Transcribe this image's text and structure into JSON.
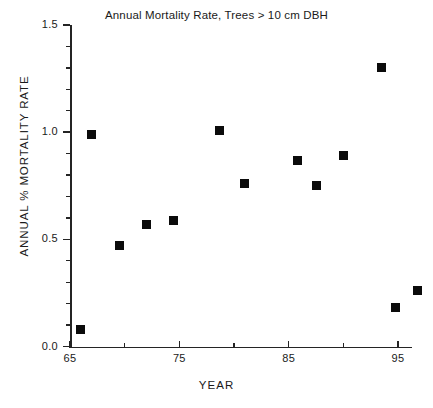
{
  "chart_data": {
    "type": "scatter",
    "title": "Annual Mortality Rate, Trees > 10 cm DBH",
    "xlabel": "YEAR",
    "ylabel": "ANNUAL % MORTALITY RATE",
    "xlim": [
      65,
      97.5
    ],
    "ylim": [
      0.0,
      1.5
    ],
    "grid": false,
    "legend": "none",
    "marker": "filled-square",
    "marker_color": "#0b0b0b",
    "axis_color": "#242424",
    "background": "#ffffff",
    "xticks": [
      65,
      75,
      85,
      95
    ],
    "xtick_labels": [
      "65",
      "75",
      "85",
      "95"
    ],
    "xminor_ticks": [
      70,
      80,
      90
    ],
    "yticks": [
      0.0,
      0.5,
      1.0,
      1.5
    ],
    "ytick_labels": [
      "0.0",
      "0.5",
      "1.0",
      "1.5"
    ],
    "yminor_ticks": [
      0.1,
      0.2,
      0.3,
      0.4,
      0.6,
      0.7,
      0.8,
      0.9,
      1.1,
      1.2,
      1.3,
      1.4
    ],
    "x": [
      66.0,
      67.0,
      69.5,
      72.0,
      74.5,
      78.7,
      81.0,
      85.8,
      87.5,
      90.0,
      93.5,
      94.8,
      96.8
    ],
    "y": [
      0.08,
      0.99,
      0.47,
      0.57,
      0.59,
      1.01,
      0.76,
      0.87,
      0.75,
      0.89,
      1.3,
      0.18,
      0.26
    ],
    "points": [
      {
        "x": 66.0,
        "y": 0.08
      },
      {
        "x": 67.0,
        "y": 0.99
      },
      {
        "x": 69.5,
        "y": 0.47
      },
      {
        "x": 72.0,
        "y": 0.57
      },
      {
        "x": 74.5,
        "y": 0.59
      },
      {
        "x": 78.7,
        "y": 1.01
      },
      {
        "x": 81.0,
        "y": 0.76
      },
      {
        "x": 85.8,
        "y": 0.87
      },
      {
        "x": 87.5,
        "y": 0.75
      },
      {
        "x": 90.0,
        "y": 0.89
      },
      {
        "x": 93.5,
        "y": 1.3
      },
      {
        "x": 94.8,
        "y": 0.18
      },
      {
        "x": 96.8,
        "y": 0.26
      }
    ]
  }
}
